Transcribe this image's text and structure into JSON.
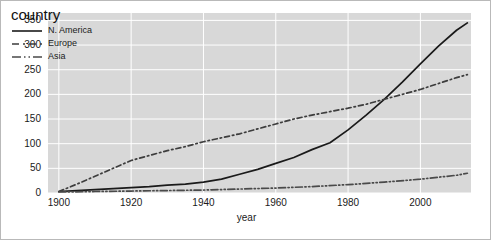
{
  "chart_data": {
    "type": "line",
    "title": "",
    "xlabel": "year",
    "ylabel": "",
    "xlim": [
      1897,
      2014
    ],
    "ylim": [
      0,
      365
    ],
    "xticks": [
      1900,
      1920,
      1940,
      1960,
      1980,
      2000
    ],
    "yticks": [
      0,
      50,
      100,
      150,
      200,
      250,
      300,
      350
    ],
    "grid": true,
    "legend_position": "top-left-inside",
    "legend_title": "country",
    "series": [
      {
        "name": "N. America",
        "style": "solid",
        "color": "#1a1a1a",
        "x": [
          1900,
          1905,
          1910,
          1915,
          1920,
          1925,
          1930,
          1935,
          1940,
          1945,
          1950,
          1955,
          1960,
          1965,
          1970,
          1975,
          1980,
          1985,
          1990,
          1995,
          2000,
          2005,
          2010,
          2013
        ],
        "y": [
          3,
          5,
          7,
          9,
          11,
          13,
          16,
          18,
          22,
          28,
          38,
          48,
          60,
          72,
          88,
          102,
          128,
          158,
          190,
          225,
          262,
          298,
          330,
          345
        ]
      },
      {
        "name": "Europe",
        "style": "dashed",
        "color": "#3d3d3d",
        "x": [
          1900,
          1905,
          1910,
          1915,
          1920,
          1925,
          1930,
          1935,
          1940,
          1945,
          1950,
          1955,
          1960,
          1965,
          1970,
          1975,
          1980,
          1985,
          1990,
          1995,
          2000,
          2005,
          2010,
          2013
        ],
        "y": [
          3,
          18,
          34,
          50,
          66,
          76,
          86,
          94,
          104,
          112,
          120,
          130,
          140,
          150,
          158,
          165,
          172,
          180,
          190,
          200,
          210,
          222,
          234,
          240
        ]
      },
      {
        "name": "Asia",
        "style": "dashdot",
        "color": "#4a4a4a",
        "x": [
          1900,
          1910,
          1920,
          1930,
          1940,
          1950,
          1960,
          1970,
          1980,
          1990,
          2000,
          2010,
          2013
        ],
        "y": [
          2,
          3,
          4,
          5,
          6,
          8,
          10,
          13,
          17,
          22,
          28,
          36,
          40
        ]
      }
    ]
  },
  "axes": {
    "yticklabels": [
      "0",
      "50",
      "100",
      "150",
      "200",
      "250",
      "300",
      "350"
    ],
    "xticklabels": [
      "1900",
      "1920",
      "1940",
      "1960",
      "1980",
      "2000"
    ],
    "xlabel": "year"
  },
  "legend": {
    "title": "country",
    "entries": [
      {
        "label": "N. America",
        "key": "solid-line-key"
      },
      {
        "label": "Europe",
        "key": "dashed-line-key"
      },
      {
        "label": "Asia",
        "key": "dashdot-line-key"
      }
    ]
  }
}
